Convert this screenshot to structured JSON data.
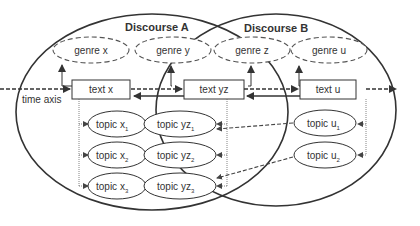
{
  "discourses": [
    {
      "id": "A",
      "label": "Discourse A"
    },
    {
      "id": "B",
      "label": "Discourse B"
    }
  ],
  "genres": [
    {
      "id": "x",
      "label": "genre x"
    },
    {
      "id": "y",
      "label": "genre y"
    },
    {
      "id": "z",
      "label": "genre z"
    },
    {
      "id": "u",
      "label": "genre u"
    }
  ],
  "texts": [
    {
      "id": "x",
      "label": "text x"
    },
    {
      "id": "yz",
      "label": "text yz"
    },
    {
      "id": "u",
      "label": "text u"
    }
  ],
  "topics": [
    {
      "id": "x1",
      "base": "topic x",
      "sub": "1"
    },
    {
      "id": "x2",
      "base": "topic x",
      "sub": "2"
    },
    {
      "id": "x3",
      "base": "topic x",
      "sub": "3"
    },
    {
      "id": "yz1",
      "base": "topic yz",
      "sub": "1"
    },
    {
      "id": "yz2",
      "base": "topic yz",
      "sub": "2"
    },
    {
      "id": "yz3",
      "base": "topic yz",
      "sub": "3"
    },
    {
      "id": "u1",
      "base": "topic u",
      "sub": "1"
    },
    {
      "id": "u2",
      "base": "topic u",
      "sub": "2"
    }
  ],
  "axis": {
    "label": "time axis"
  },
  "colors": {
    "line": "#333333",
    "dashed": "#555555",
    "text": "#333333"
  }
}
